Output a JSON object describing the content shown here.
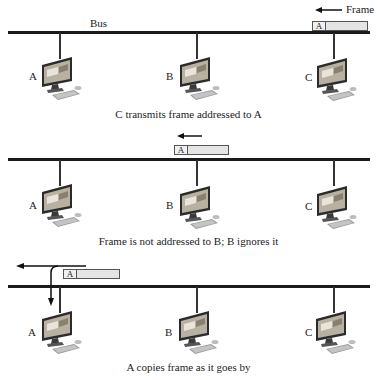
{
  "bus_label": "Bus",
  "frame_label": "Frame",
  "colors": {
    "bus": "#1a1a1a",
    "frame_fill": "#e4e4e4",
    "frame_border": "#555555",
    "monitor": "#2b2b2b",
    "screen": "#b8b0a0"
  },
  "panels": [
    {
      "caption": "C transmits frame addressed to A",
      "frame_address": "A",
      "frame_direction": "left",
      "stations": [
        {
          "label": "A"
        },
        {
          "label": "B"
        },
        {
          "label": "C"
        }
      ]
    },
    {
      "caption": "Frame is not addressed to B; B ignores it",
      "frame_address": "A",
      "frame_direction": "left",
      "stations": [
        {
          "label": "A"
        },
        {
          "label": "B"
        },
        {
          "label": "C"
        }
      ]
    },
    {
      "caption": "A copies frame as it goes by",
      "frame_address": "A",
      "frame_direction": "left",
      "stations": [
        {
          "label": "A"
        },
        {
          "label": "B"
        },
        {
          "label": "C"
        }
      ]
    }
  ]
}
